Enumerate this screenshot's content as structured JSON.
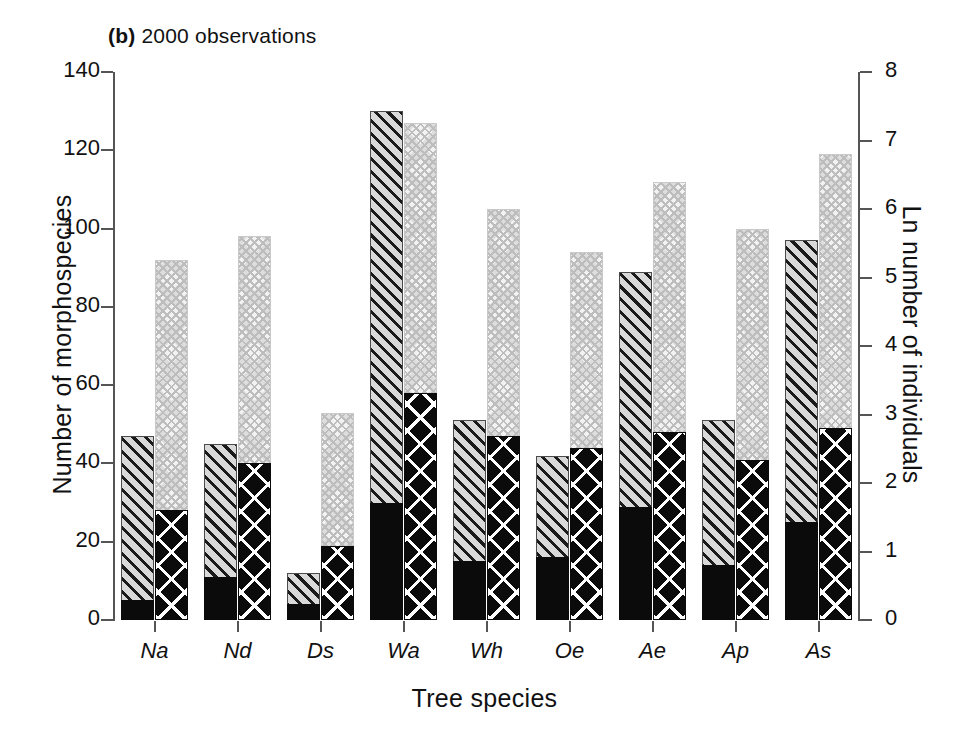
{
  "chart_data": {
    "type": "bar",
    "title": "(b) 2000 observations",
    "title_letter": "(b)",
    "title_text": "2000 observations",
    "xlabel": "Tree species",
    "ylabel": "Number of morphospecies",
    "ylabel_right": "Ln number of individuals",
    "categories": [
      "Na",
      "Nd",
      "Ds",
      "Wa",
      "Wh",
      "Oe",
      "Ae",
      "Ap",
      "As"
    ],
    "ylim": [
      0,
      140
    ],
    "yticks": [
      0,
      20,
      40,
      60,
      80,
      100,
      120,
      140
    ],
    "ylim_right": [
      0,
      8
    ],
    "yticks_right": [
      0,
      1,
      2,
      3,
      4,
      5,
      6,
      7,
      8
    ],
    "grid": false,
    "legend": "none",
    "series": [
      {
        "name": "Total morphospecies",
        "axis": "left",
        "pattern": "diagonal-hatch",
        "values": [
          47,
          45,
          12,
          130,
          51,
          42,
          89,
          51,
          97
        ]
      },
      {
        "name": "Singleton morphospecies",
        "axis": "left",
        "pattern": "solid-black",
        "values": [
          5,
          11,
          4,
          30,
          15,
          16,
          29,
          14,
          25
        ]
      },
      {
        "name": "Ln number of individuals",
        "axis": "right",
        "pattern": "light-crosshatch",
        "values_left_scale": [
          92,
          98,
          53,
          127,
          105,
          94,
          112,
          100,
          119
        ],
        "values": [
          5.26,
          5.6,
          3.03,
          7.26,
          6.0,
          5.37,
          6.4,
          5.71,
          6.8
        ]
      },
      {
        "name": "Ln number of individuals (subset)",
        "axis": "right",
        "pattern": "dark-crosshatch",
        "values_left_scale": [
          28,
          40,
          19,
          58,
          47,
          44,
          48,
          41,
          49
        ],
        "values": [
          1.6,
          2.29,
          1.09,
          3.31,
          2.69,
          2.51,
          2.74,
          2.34,
          2.8
        ]
      }
    ]
  },
  "axis": {
    "left_ticks": [
      "140",
      "120",
      "100",
      "80",
      "60",
      "40",
      "20",
      "0"
    ],
    "right_ticks": [
      "8",
      "7",
      "6",
      "5",
      "4",
      "3",
      "2",
      "1",
      "0"
    ]
  }
}
